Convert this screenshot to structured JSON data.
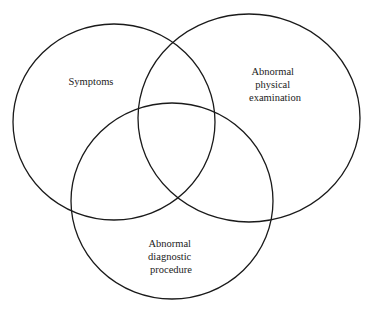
{
  "diagram": {
    "type": "venn",
    "sets": [
      {
        "id": "symptoms",
        "label_lines": [
          "Symptoms"
        ]
      },
      {
        "id": "physical",
        "label_lines": [
          "Abnormal",
          "physical",
          "examination"
        ]
      },
      {
        "id": "diagnostic",
        "label_lines": [
          "Abnormal",
          "diagnostic",
          "procedure"
        ]
      }
    ],
    "colors": {
      "stroke": "#1a1a1a",
      "text": "#222222",
      "background": "#ffffff"
    }
  }
}
